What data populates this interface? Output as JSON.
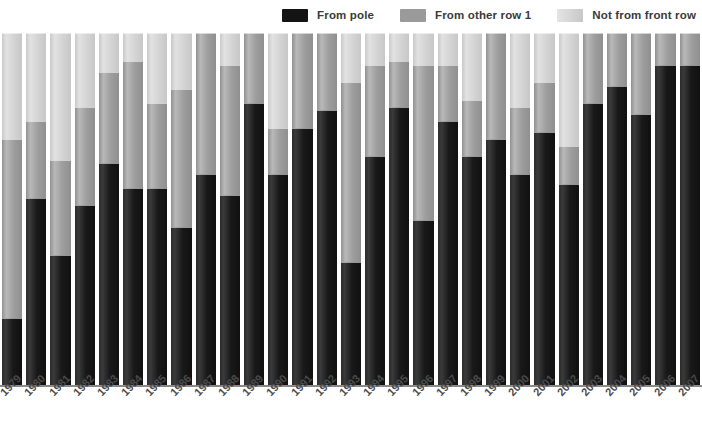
{
  "legend": {
    "position": "top-right",
    "items": [
      {
        "label": "From pole",
        "color": "#141414",
        "key": "from_pole"
      },
      {
        "label": "From other row 1",
        "color": "#9a9a9a",
        "key": "from_other_row_1"
      },
      {
        "label": "Not from front row",
        "color": "#d2d2d2",
        "key": "not_from_front_row"
      }
    ]
  },
  "axis": {
    "baseline_color": "#8a8a8a",
    "label_rotation_deg": -47
  },
  "chart_data": {
    "type": "bar",
    "stacked": true,
    "normalized_percent": true,
    "title": "",
    "subtitle": "",
    "xlabel": "",
    "ylabel": "",
    "ylim": [
      0,
      100
    ],
    "grid": false,
    "legend_position": "top-right",
    "categories": [
      "1979",
      "1980",
      "1981",
      "1982",
      "1983",
      "1984",
      "1985",
      "1986",
      "1987",
      "1988",
      "1989",
      "1990",
      "1991",
      "1992",
      "1993",
      "1994",
      "1995",
      "1996",
      "1997",
      "1998",
      "1999",
      "2000",
      "2001",
      "2002",
      "2003",
      "2004",
      "2005",
      "2006",
      "2007"
    ],
    "series": [
      {
        "name": "From pole",
        "color": "#141414",
        "values": [
          19,
          53,
          37,
          51,
          63,
          56,
          56,
          45,
          60,
          54,
          80,
          60,
          73,
          78,
          35,
          65,
          79,
          47,
          75,
          65,
          70,
          60,
          72,
          57,
          80,
          85,
          77,
          91,
          91
        ]
      },
      {
        "name": "From other row 1",
        "color": "#9a9a9a",
        "values": [
          51,
          22,
          27,
          28,
          26,
          36,
          24,
          39,
          40,
          37,
          20,
          13,
          27,
          22,
          51,
          26,
          13,
          44,
          16,
          16,
          30,
          19,
          14,
          11,
          20,
          15,
          23,
          9,
          9
        ]
      },
      {
        "name": "Not from front row",
        "color": "#d2d2d2",
        "values": [
          30,
          25,
          36,
          21,
          11,
          8,
          20,
          16,
          0,
          9,
          0,
          27,
          0,
          0,
          14,
          9,
          8,
          9,
          9,
          19,
          0,
          21,
          14,
          32,
          0,
          0,
          0,
          0,
          0
        ]
      }
    ]
  }
}
